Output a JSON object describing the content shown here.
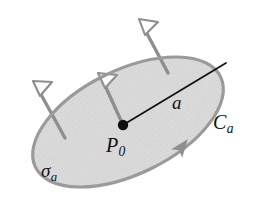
{
  "figure": {
    "background_color": "#ffffff",
    "surface": {
      "name": "sigma-a",
      "label": "σ",
      "label_sub": "a",
      "fill_color": "#d6d6d6",
      "stroke_color": "#9a9a9a",
      "stroke_width": 3.2,
      "center_x": 128,
      "center_y": 122,
      "radius_x": 103,
      "radius_y": 52,
      "rotation_deg": -26
    },
    "boundary_curve": {
      "name": "C-a",
      "label": "C",
      "label_sub": "a",
      "color": "#9a9a9a",
      "orientation": "counterclockwise"
    },
    "center_point": {
      "name": "P-0",
      "label": "P",
      "label_sub": "0",
      "color": "#101010",
      "x": 123,
      "y": 125,
      "dot_radius": 5.2
    },
    "radius_segment": {
      "name": "a",
      "label": "a",
      "color": "#101010",
      "stroke_width": 1.7,
      "from_x": 123,
      "from_y": 125,
      "to_x": 226,
      "to_y": 63
    },
    "circulation_arrow": {
      "name": "circulation-arrowhead",
      "fill_color": "#8f8f8f",
      "x": 181,
      "y": 148,
      "rotation_deg": -52
    },
    "normal_vectors": [
      {
        "name": "normal-vector-left",
        "tail_x": 65,
        "tail_y": 138,
        "head_x": 33,
        "head_y": 81,
        "shaft_color": "#8e8e8e",
        "head_fill": "#fdfdfd",
        "head_stroke": "#8e8e8e"
      },
      {
        "name": "normal-vector-middle",
        "tail_x": 123,
        "tail_y": 125,
        "head_x": 98,
        "head_y": 73,
        "shaft_color": "#8e8e8e",
        "head_fill": "#fdfdfd",
        "head_stroke": "#8e8e8e"
      },
      {
        "name": "normal-vector-top",
        "tail_x": 168,
        "tail_y": 73,
        "head_x": 139,
        "head_y": 19,
        "shaft_color": "#8e8e8e",
        "head_fill": "#fdfdfd",
        "head_stroke": "#8e8e8e"
      }
    ]
  }
}
